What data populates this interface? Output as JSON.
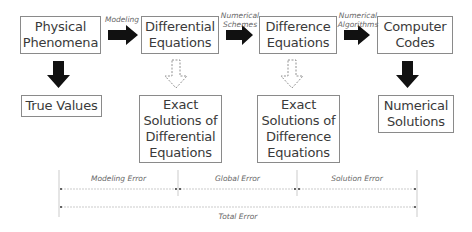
{
  "diagram": {
    "boxes": {
      "physical": "Physical\nPhenomena",
      "differential": "Differential\nEquations",
      "difference": "Difference\nEquations",
      "computer": "Computer\nCodes",
      "true_values": "True Values",
      "exact_diff": "Exact\nSolutions of\nDifferential\nEquations",
      "exact_difference": "Exact\nSolutions of\nDifference\nEquations",
      "numerical_solutions": "Numerical\nSolutions"
    },
    "arrow_labels": {
      "modeling": "Modeling",
      "numerical_schemes": "Numerical\nSchemes",
      "numerical_algorithms": "Numerical\nAlgorithms"
    },
    "errors": {
      "modeling": "Modeling Error",
      "global": "Global Error",
      "solution": "Solution Error",
      "total": "Total Error"
    }
  }
}
